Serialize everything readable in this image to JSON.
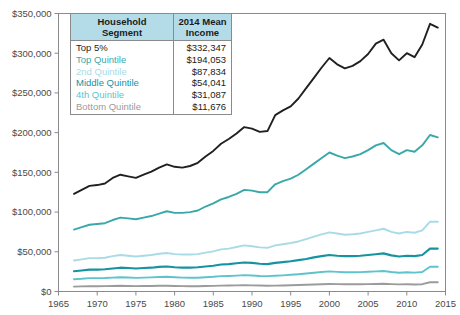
{
  "legend": {
    "header_segment": "Household Segment",
    "header_segment_line1": "Household",
    "header_segment_line2": "Segment",
    "header_income_line1": "2014 Mean",
    "header_income_line2": "Income",
    "rows": [
      {
        "label": "Top 5%",
        "value": "$332,347",
        "color": "#231f20"
      },
      {
        "label": "Top Quintile",
        "value": "$194,053",
        "color": "#3aa8a8"
      },
      {
        "label": "2nd Quintile",
        "value": "$87,834",
        "color": "#a9dbe6"
      },
      {
        "label": "Middle Quintile",
        "value": "$54,041",
        "color": "#1593a0"
      },
      {
        "label": "4th Quintile",
        "value": "$31,087",
        "color": "#5ec4cc"
      },
      {
        "label": "Bottom Quintile",
        "value": "$11,676",
        "color": "#9b9b9b"
      }
    ]
  },
  "chart_data": {
    "type": "line",
    "title": "",
    "xlabel": "",
    "ylabel": "",
    "xlim": [
      1965,
      2015
    ],
    "ylim": [
      0,
      350000
    ],
    "grid": false,
    "legend_position": "inside-top-left",
    "xticks": [
      1965,
      1970,
      1975,
      1980,
      1985,
      1990,
      1995,
      2000,
      2005,
      2010,
      2015
    ],
    "yticks": [
      0,
      50000,
      100000,
      150000,
      200000,
      250000,
      300000,
      350000
    ],
    "ytick_labels": [
      "$0",
      "$50,000",
      "$100,000",
      "$150,000",
      "$200,000",
      "$250,000",
      "$300,000",
      "$350,000"
    ],
    "xtick_labels": [
      "1965",
      "1970",
      "1975",
      "1980",
      "1985",
      "1990",
      "1995",
      "2000",
      "2005",
      "2010",
      "2015"
    ],
    "x": [
      1967,
      1968,
      1969,
      1970,
      1971,
      1972,
      1973,
      1974,
      1975,
      1976,
      1977,
      1978,
      1979,
      1980,
      1981,
      1982,
      1983,
      1984,
      1985,
      1986,
      1987,
      1988,
      1989,
      1990,
      1991,
      1992,
      1993,
      1994,
      1995,
      1996,
      1997,
      1998,
      1999,
      2000,
      2001,
      2002,
      2003,
      2004,
      2005,
      2006,
      2007,
      2008,
      2009,
      2010,
      2011,
      2012,
      2013,
      2014
    ],
    "series": [
      {
        "name": "Top 5%",
        "color": "#231f20",
        "width": 1.9,
        "values": [
          123000,
          128000,
          133000,
          134000,
          136000,
          143000,
          147000,
          145000,
          143000,
          147000,
          151000,
          156000,
          160000,
          157000,
          156000,
          158000,
          162000,
          170000,
          177000,
          186000,
          192000,
          199000,
          207000,
          205000,
          201000,
          202000,
          222000,
          228000,
          233000,
          243000,
          256000,
          269000,
          282000,
          294000,
          286000,
          281000,
          284000,
          290000,
          299000,
          312000,
          317000,
          300000,
          291000,
          300000,
          295000,
          311000,
          337000,
          332347
        ]
      },
      {
        "name": "Top Quintile",
        "color": "#3aa8a8",
        "width": 1.9,
        "values": [
          78000,
          81000,
          84000,
          85000,
          86000,
          90000,
          93000,
          92000,
          91000,
          93000,
          95000,
          98000,
          101000,
          99000,
          99000,
          100000,
          102000,
          107000,
          111000,
          116000,
          119000,
          123000,
          128000,
          127000,
          125000,
          125000,
          135000,
          139000,
          142000,
          147000,
          154000,
          161000,
          168000,
          175000,
          171000,
          168000,
          170000,
          173000,
          178000,
          184000,
          187000,
          178000,
          173000,
          178000,
          176000,
          184000,
          197000,
          194053
        ]
      },
      {
        "name": "2nd Quintile",
        "color": "#a9dbe6",
        "width": 1.9,
        "values": [
          39000,
          40500,
          42000,
          42000,
          42500,
          44500,
          46000,
          45000,
          44000,
          45000,
          46000,
          47500,
          48500,
          47000,
          46500,
          46500,
          47000,
          49000,
          50500,
          53000,
          54000,
          56000,
          58000,
          57000,
          55500,
          55000,
          58000,
          59500,
          61000,
          63000,
          66000,
          69000,
          72000,
          74500,
          73000,
          71500,
          72000,
          73000,
          75000,
          77000,
          79000,
          75000,
          73000,
          75000,
          74000,
          77000,
          88000,
          87834
        ]
      },
      {
        "name": "Middle Quintile",
        "color": "#1593a0",
        "width": 2.1,
        "values": [
          25500,
          26500,
          27500,
          27500,
          28000,
          29000,
          30000,
          29500,
          29000,
          29500,
          30000,
          31000,
          31500,
          30500,
          30000,
          30000,
          30500,
          31500,
          32500,
          34000,
          34500,
          35500,
          36500,
          36000,
          35000,
          34500,
          36000,
          37000,
          38000,
          39500,
          41000,
          43000,
          44500,
          46000,
          45000,
          44500,
          44500,
          45000,
          46000,
          47000,
          48000,
          45500,
          44000,
          45000,
          44500,
          46000,
          54000,
          54041
        ]
      },
      {
        "name": "4th Quintile",
        "color": "#5ec4cc",
        "width": 1.9,
        "values": [
          15500,
          16000,
          16800,
          16800,
          17000,
          17500,
          18000,
          17600,
          17200,
          17500,
          17800,
          18200,
          18500,
          17900,
          17500,
          17300,
          17400,
          18000,
          18500,
          19300,
          19600,
          20000,
          20600,
          20200,
          19600,
          19300,
          19800,
          20300,
          21000,
          21800,
          22700,
          23700,
          24500,
          25300,
          24700,
          24200,
          24200,
          24400,
          24800,
          25300,
          25800,
          24500,
          23700,
          24200,
          23800,
          24600,
          31100,
          31087
        ]
      },
      {
        "name": "Bottom Quintile",
        "color": "#9b9b9b",
        "width": 1.9,
        "values": [
          6200,
          6400,
          6700,
          6700,
          6800,
          7000,
          7200,
          7000,
          6800,
          6900,
          7000,
          7200,
          7300,
          7000,
          6800,
          6700,
          6700,
          6900,
          7100,
          7400,
          7500,
          7700,
          7900,
          7700,
          7500,
          7300,
          7400,
          7600,
          7900,
          8200,
          8500,
          8900,
          9200,
          9500,
          9300,
          9100,
          9100,
          9200,
          9300,
          9500,
          9700,
          9300,
          9000,
          9100,
          8900,
          9200,
          11700,
          11676
        ]
      }
    ]
  }
}
